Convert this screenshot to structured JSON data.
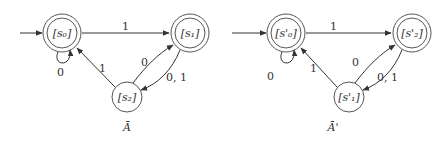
{
  "automata": [
    {
      "caption": "Ā",
      "states": [
        {
          "id": "s0",
          "label": "[s₀]",
          "accepting": true,
          "initial": true
        },
        {
          "id": "s1",
          "label": "[s₁]",
          "accepting": true,
          "initial": false
        },
        {
          "id": "s2",
          "label": "[s₂]",
          "accepting": false,
          "initial": false
        }
      ],
      "transitions": [
        {
          "from": "s0",
          "to": "s0",
          "label": "0"
        },
        {
          "from": "s0",
          "to": "s1",
          "label": "1"
        },
        {
          "from": "s1",
          "to": "s2",
          "label": "0, 1"
        },
        {
          "from": "s2",
          "to": "s1",
          "label": "0"
        },
        {
          "from": "s2",
          "to": "s0",
          "label": "1"
        }
      ]
    },
    {
      "caption": "Ā'",
      "states": [
        {
          "id": "s0p",
          "label": "[s'₀]",
          "accepting": true,
          "initial": true
        },
        {
          "id": "s2p",
          "label": "[s'₂]",
          "accepting": true,
          "initial": false
        },
        {
          "id": "s1p",
          "label": "[s'₁]",
          "accepting": false,
          "initial": false
        }
      ],
      "transitions": [
        {
          "from": "s0p",
          "to": "s0p",
          "label": "0"
        },
        {
          "from": "s0p",
          "to": "s2p",
          "label": "1"
        },
        {
          "from": "s2p",
          "to": "s1p",
          "label": "0, 1"
        },
        {
          "from": "s1p",
          "to": "s2p",
          "label": "0"
        },
        {
          "from": "s1p",
          "to": "s0p",
          "label": "1"
        }
      ]
    }
  ]
}
